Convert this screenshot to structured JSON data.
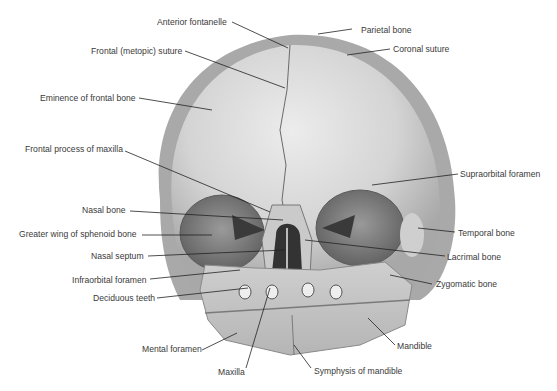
{
  "figure": {
    "colors": {
      "bone_light": "#dedede",
      "bone_mid": "#bdbdbd",
      "bone_dark": "#8a8a8a",
      "orbit": "#7a7a7a",
      "leader": "#222222",
      "text": "#3a3a3a"
    }
  },
  "labels": {
    "anterior_fontanelle": "Anterior fontanelle",
    "parietal_bone": "Parietal bone",
    "frontal_metopic_suture": "Frontal (metopic) suture",
    "coronal_suture": "Coronal suture",
    "eminence_frontal_bone": "Eminence of frontal bone",
    "frontal_process_maxilla": "Frontal process of maxilla",
    "supraorbital_foramen": "Supraorbital foramen",
    "nasal_bone": "Nasal bone",
    "greater_wing_sphenoid": "Greater wing of sphenoid bone",
    "temporal_bone": "Temporal bone",
    "nasal_septum": "Nasal septum",
    "lacrimal_bone": "Lacrimal bone",
    "infraorbital_foramen": "Infraorbital foramen",
    "zygomatic_bone": "Zygomatic bone",
    "deciduous_teeth": "Deciduous teeth",
    "mandible": "Mandible",
    "mental_foramen": "Mental foramen",
    "maxilla": "Maxilla",
    "symphysis_mandible": "Symphysis of mandible"
  }
}
